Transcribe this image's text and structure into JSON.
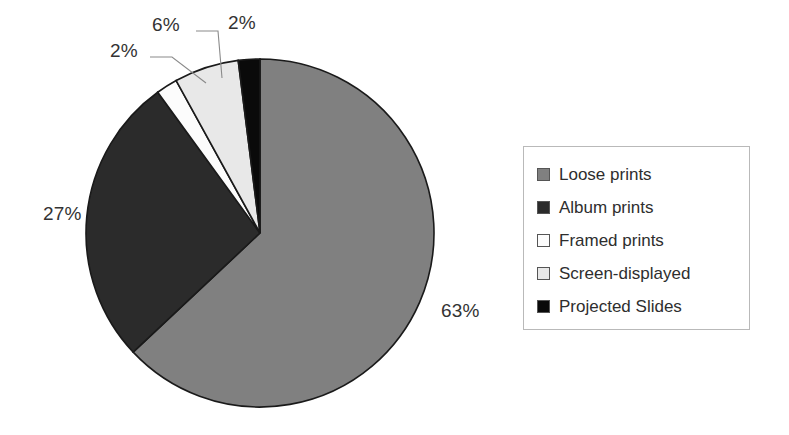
{
  "chart_data": {
    "type": "pie",
    "title": "",
    "subtitle": "",
    "xlabel": "",
    "ylabel": "",
    "grid": false,
    "legend_position": "right",
    "start_angle_deg": 0,
    "direction": "clockwise",
    "categories": [
      "Loose prints",
      "Album prints",
      "Framed prints",
      "Screen-displayed",
      "Projected Slides"
    ],
    "values": [
      63,
      27,
      2,
      6,
      2
    ],
    "value_unit": "%",
    "slices": [
      {
        "label": "Loose prints",
        "value": 63,
        "display": "63%",
        "color": "#808080",
        "stroke": "#1a1a1a"
      },
      {
        "label": "Album prints",
        "value": 27,
        "display": "27%",
        "color": "#2b2b2b",
        "stroke": "#1a1a1a"
      },
      {
        "label": "Framed prints",
        "value": 2,
        "display": "2%",
        "color": "#fcfcfc",
        "stroke": "#1a1a1a"
      },
      {
        "label": "Screen-displayed",
        "value": 6,
        "display": "6%",
        "color": "#e8e8e8",
        "stroke": "#1a1a1a"
      },
      {
        "label": "Projected Slides",
        "value": 2,
        "display": "2%",
        "color": "#0a0a0a",
        "stroke": "#1a1a1a"
      }
    ],
    "data_labels": [
      {
        "name": "loose-prints",
        "display": "63%"
      },
      {
        "name": "album-prints",
        "display": "27%"
      },
      {
        "name": "framed-prints",
        "display": "2%"
      },
      {
        "name": "screen-displayed",
        "display": "6%"
      },
      {
        "name": "projected-slides",
        "display": "2%"
      }
    ]
  },
  "legend": {
    "items": [
      {
        "label": "Loose prints",
        "color": "#808080"
      },
      {
        "label": "Album prints",
        "color": "#2b2b2b"
      },
      {
        "label": "Framed prints",
        "color": "#fcfcfc"
      },
      {
        "label": "Screen-displayed",
        "color": "#e8e8e8"
      },
      {
        "label": "Projected Slides",
        "color": "#0a0a0a"
      }
    ]
  }
}
